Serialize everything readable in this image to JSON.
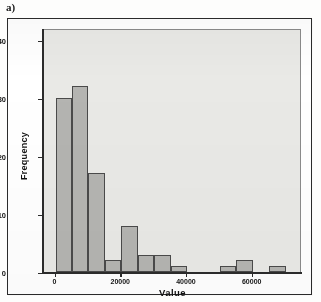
{
  "figure": {
    "panel_label": "a)"
  },
  "chart_data": {
    "type": "bar",
    "title": "",
    "subtitle": "",
    "xlabel": "Value",
    "ylabel": "Frequency",
    "grid": false,
    "legend": null,
    "xlim": [
      -3500,
      75000
    ],
    "ylim": [
      0,
      42
    ],
    "x_ticks": [
      0,
      20000,
      40000,
      60000
    ],
    "x_tick_labels": [
      "0",
      "20000",
      "40000",
      "60000"
    ],
    "y_ticks": [
      0,
      10,
      20,
      30,
      40
    ],
    "y_tick_labels": [
      "0",
      "10",
      "20",
      "30",
      "40"
    ],
    "bin_width": 5000,
    "bins": [
      {
        "start": 0,
        "end": 5000,
        "frequency": 30
      },
      {
        "start": 5000,
        "end": 10000,
        "frequency": 32
      },
      {
        "start": 10000,
        "end": 15000,
        "frequency": 17
      },
      {
        "start": 15000,
        "end": 20000,
        "frequency": 2
      },
      {
        "start": 20000,
        "end": 25000,
        "frequency": 8
      },
      {
        "start": 25000,
        "end": 30000,
        "frequency": 3
      },
      {
        "start": 30000,
        "end": 35000,
        "frequency": 3
      },
      {
        "start": 35000,
        "end": 40000,
        "frequency": 1
      },
      {
        "start": 40000,
        "end": 45000,
        "frequency": 0
      },
      {
        "start": 45000,
        "end": 50000,
        "frequency": 0
      },
      {
        "start": 50000,
        "end": 55000,
        "frequency": 1
      },
      {
        "start": 55000,
        "end": 60000,
        "frequency": 2
      },
      {
        "start": 60000,
        "end": 65000,
        "frequency": 0
      },
      {
        "start": 65000,
        "end": 70000,
        "frequency": 1
      }
    ],
    "categories": [
      "0-5000",
      "5000-10000",
      "10000-15000",
      "15000-20000",
      "20000-25000",
      "25000-30000",
      "30000-35000",
      "35000-40000",
      "40000-45000",
      "45000-50000",
      "50000-55000",
      "55000-60000",
      "60000-65000",
      "65000-70000"
    ],
    "values": [
      30,
      32,
      17,
      2,
      8,
      3,
      3,
      1,
      0,
      0,
      1,
      2,
      0,
      1
    ],
    "colors": {
      "bar_fill": "#b4b4b1",
      "bar_edge": "#4a4a4a",
      "plot_background": "#e9e9e6",
      "axis": "#2b2b2b",
      "frame": "#2b2b2b",
      "page_background": "#ffffff"
    }
  }
}
